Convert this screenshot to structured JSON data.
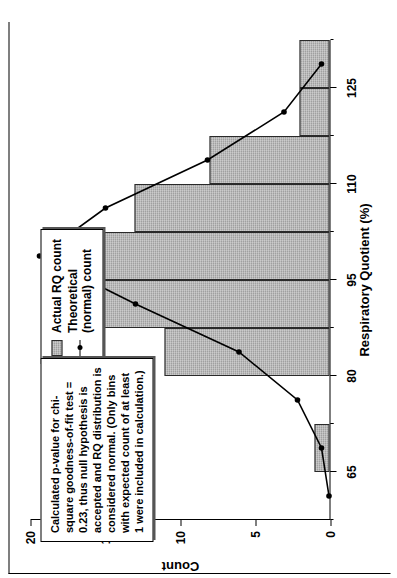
{
  "chart_data": {
    "type": "bar",
    "title": "",
    "xlabel": "Respiratory Quotient (%)",
    "ylabel": "Count",
    "xlim": [
      57.5,
      132.5
    ],
    "ylim": [
      0,
      20
    ],
    "grid": false,
    "legend_position": "top-center",
    "xticks": [
      65,
      80,
      95,
      110,
      125
    ],
    "yticks": [
      0,
      5,
      10,
      15,
      20
    ],
    "bin_width": 7.5,
    "bin_centers": [
      61.25,
      68.75,
      76.25,
      83.75,
      91.25,
      98.75,
      106.25,
      113.75,
      121.25,
      128.75
    ],
    "categories": [
      "61.25",
      "68.75",
      "76.25",
      "83.75",
      "91.25",
      "98.75",
      "106.25",
      "113.75",
      "121.25",
      "128.75"
    ],
    "values": [
      0,
      1,
      0,
      11,
      17,
      19,
      13,
      8,
      2,
      2
    ],
    "series": [
      {
        "name": "Actual RQ count",
        "type": "bar",
        "values": [
          0,
          1,
          0,
          11,
          17,
          19,
          13,
          8,
          2,
          2
        ]
      },
      {
        "name": "Theoretical (normal) count",
        "type": "line",
        "x": [
          61.25,
          68.75,
          76.25,
          83.75,
          91.25,
          98.75,
          106.25,
          113.75,
          121.25,
          128.75
        ],
        "values": [
          0.1,
          0.6,
          2.2,
          6.1,
          13.0,
          19.4,
          15.0,
          8.2,
          3.1,
          0.6
        ]
      }
    ],
    "legend": [
      {
        "label": "Actual RQ count",
        "marker": "filled-bar-swatch"
      },
      {
        "label": "Theoretical\n(normal) count",
        "marker": "line-with-dot"
      }
    ],
    "annotation": "Calculated p-value for chi-square goodness-of-fit test = 0.23, thus null hypothesis is accepted and RQ distribution is considered normal. (Only bins with expected count of at least 1 were included in calculation.)"
  },
  "colors": {
    "bar_fill": "#a0a0a0",
    "bar_stroke": "#2a2a2a",
    "line": "#000000",
    "axis": "#000000",
    "background": "#ffffff"
  }
}
